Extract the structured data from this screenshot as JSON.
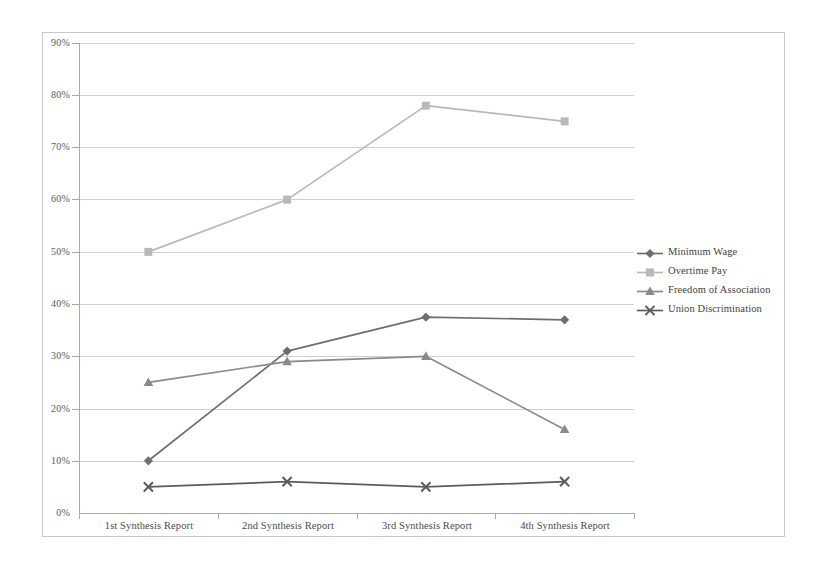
{
  "chart_data": {
    "type": "line",
    "title": "",
    "subtitle": "",
    "xlabel": "",
    "ylabel": "",
    "categories": [
      "1st Synthesis Report",
      "2nd Synthesis Report",
      "3rd Synthesis Report",
      "4th Synthesis Report"
    ],
    "ylim": [
      0,
      90
    ],
    "ytick_labels": [
      "0%",
      "10%",
      "20%",
      "30%",
      "40%",
      "50%",
      "60%",
      "70%",
      "80%",
      "90%"
    ],
    "ytick_values": [
      0,
      10,
      20,
      30,
      40,
      50,
      60,
      70,
      80,
      90
    ],
    "y_unit": "%",
    "grid": true,
    "legend_position": "right",
    "series": [
      {
        "name": "Minimum Wage",
        "values": [
          10,
          31,
          37.5,
          37
        ],
        "color": "#6e6e70",
        "marker": "diamond"
      },
      {
        "name": "Overtime Pay",
        "values": [
          50,
          60,
          78,
          75
        ],
        "color": "#b9b9bb",
        "marker": "square"
      },
      {
        "name": "Freedom of Association",
        "values": [
          25,
          29,
          30,
          16
        ],
        "color": "#8a8a8c",
        "marker": "triangle"
      },
      {
        "name": "Union Discrimination",
        "values": [
          5,
          6,
          5,
          6
        ],
        "color": "#5c5c5e",
        "marker": "cross"
      }
    ]
  },
  "legend": {
    "items": [
      {
        "label": "Minimum Wage"
      },
      {
        "label": "Overtime Pay"
      },
      {
        "label": "Freedom of Association"
      },
      {
        "label": "Union Discrimination"
      }
    ]
  },
  "axes": {
    "y_labels": [
      "90%",
      "80%",
      "70%",
      "60%",
      "50%",
      "40%",
      "30%",
      "20%",
      "10%",
      "0%"
    ],
    "x_labels": [
      "1st Synthesis Report",
      "2nd Synthesis Report",
      "3rd Synthesis Report",
      "4th Synthesis Report"
    ]
  }
}
